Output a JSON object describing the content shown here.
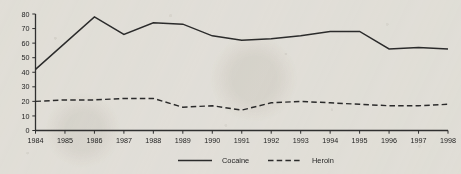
{
  "chart_data": {
    "type": "line",
    "title": "",
    "subtitle": "",
    "xlabel": "",
    "ylabel": "",
    "xlim": [
      1984,
      1998
    ],
    "ylim": [
      0,
      80
    ],
    "grid": false,
    "legend_position": "bottom-center",
    "categories": [
      "1984",
      "1985",
      "1986",
      "1987",
      "1988",
      "1989",
      "1990",
      "1991",
      "1992",
      "1993",
      "1994",
      "1995",
      "1996",
      "1997",
      "1998"
    ],
    "x": [
      1984,
      1985,
      1986,
      1987,
      1988,
      1989,
      1990,
      1991,
      1992,
      1993,
      1994,
      1995,
      1996,
      1997,
      1998
    ],
    "y_ticks": [
      0,
      10,
      20,
      30,
      40,
      50,
      60,
      70,
      80
    ],
    "y_tick_labels": [
      "0",
      "10",
      "20",
      "30",
      "40",
      "50",
      "60",
      "70",
      "80"
    ],
    "series": [
      {
        "name": "Cocaine",
        "style": "solid",
        "color": "#2b2b2b",
        "values": [
          42,
          60,
          78,
          66,
          74,
          73,
          65,
          62,
          63,
          65,
          68,
          68,
          56,
          57,
          56
        ]
      },
      {
        "name": "Heroin",
        "style": "dashed",
        "color": "#2b2b2b",
        "values": [
          20,
          21,
          21,
          22,
          22,
          16,
          17,
          14,
          19,
          20,
          19,
          18,
          17,
          17,
          18
        ]
      }
    ]
  },
  "legend": {
    "items": [
      {
        "label": "Cocaine",
        "style": "solid"
      },
      {
        "label": "Heroin",
        "style": "dashed"
      }
    ]
  },
  "axes": {
    "y_axis_name": "value-axis",
    "x_axis_name": "year-axis"
  }
}
